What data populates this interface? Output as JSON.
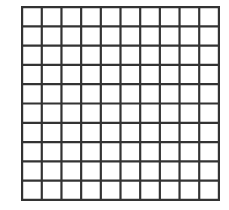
{
  "diagram": {
    "type": "square-grid",
    "rows": 10,
    "columns": 10,
    "line_color": "#333333",
    "background_color": "#ffffff",
    "cell_fill": "#ffffff"
  }
}
